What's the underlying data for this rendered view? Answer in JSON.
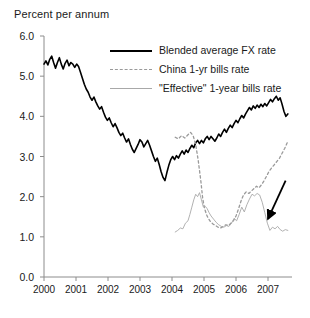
{
  "chart_data": {
    "type": "line",
    "title": "Percent per annum",
    "xlabel": "",
    "ylabel": "Percent per annum",
    "xlim": [
      2000,
      2007.75
    ],
    "ylim": [
      0.0,
      6.0
    ],
    "grid": false,
    "legend_position": "top-right-inside",
    "ytick_labels": [
      "0.0",
      "1.0",
      "2.0",
      "3.0",
      "4.0",
      "5.0",
      "6.0"
    ],
    "ytick_values": [
      0.0,
      1.0,
      2.0,
      3.0,
      4.0,
      5.0,
      6.0
    ],
    "xtick_labels": [
      "2000",
      "2001",
      "2002",
      "2003",
      "2004",
      "2005",
      "2006",
      "2007"
    ],
    "xtick_values": [
      2000,
      2001,
      2002,
      2003,
      2004,
      2005,
      2006,
      2007
    ],
    "annotations": [
      {
        "name": "arrow-annotation",
        "type": "arrow",
        "from_xy": [
          2007.55,
          2.4
        ],
        "to_xy": [
          2007.0,
          1.45
        ],
        "text": ""
      }
    ],
    "series": [
      {
        "name": "Blended average FX rate",
        "style": "solid",
        "color": "#000000",
        "width": 1.6,
        "x": [
          2000.0,
          2000.06,
          2000.12,
          2000.18,
          2000.24,
          2000.3,
          2000.36,
          2000.42,
          2000.48,
          2000.54,
          2000.6,
          2000.66,
          2000.72,
          2000.78,
          2000.84,
          2000.9,
          2000.96,
          2001.02,
          2001.08,
          2001.14,
          2001.2,
          2001.26,
          2001.32,
          2001.38,
          2001.44,
          2001.5,
          2001.56,
          2001.62,
          2001.68,
          2001.74,
          2001.8,
          2001.86,
          2001.92,
          2001.98,
          2002.04,
          2002.1,
          2002.16,
          2002.22,
          2002.28,
          2002.34,
          2002.4,
          2002.46,
          2002.52,
          2002.58,
          2002.64,
          2002.7,
          2002.76,
          2002.82,
          2002.88,
          2002.94,
          2003.0,
          2003.06,
          2003.12,
          2003.18,
          2003.24,
          2003.3,
          2003.36,
          2003.42,
          2003.48,
          2003.54,
          2003.6,
          2003.66,
          2003.72,
          2003.78,
          2003.84,
          2003.9,
          2003.96,
          2004.02,
          2004.08,
          2004.14,
          2004.2,
          2004.26,
          2004.32,
          2004.38,
          2004.44,
          2004.5,
          2004.56,
          2004.62,
          2004.68,
          2004.74,
          2004.8,
          2004.86,
          2004.92,
          2004.98,
          2005.04,
          2005.1,
          2005.16,
          2005.22,
          2005.28,
          2005.34,
          2005.4,
          2005.46,
          2005.52,
          2005.58,
          2005.64,
          2005.7,
          2005.76,
          2005.82,
          2005.88,
          2005.94,
          2006.0,
          2006.06,
          2006.12,
          2006.18,
          2006.24,
          2006.3,
          2006.36,
          2006.42,
          2006.48,
          2006.54,
          2006.6,
          2006.66,
          2006.72,
          2006.78,
          2006.84,
          2006.9,
          2006.96,
          2007.02,
          2007.08,
          2007.14,
          2007.2,
          2007.26,
          2007.32,
          2007.38,
          2007.44,
          2007.5,
          2007.56,
          2007.62
        ],
        "y": [
          5.3,
          5.38,
          5.28,
          5.42,
          5.5,
          5.34,
          5.2,
          5.34,
          5.46,
          5.3,
          5.18,
          5.32,
          5.4,
          5.26,
          5.34,
          5.3,
          5.22,
          5.3,
          5.24,
          5.1,
          4.95,
          4.8,
          4.68,
          4.6,
          4.48,
          4.4,
          4.48,
          4.36,
          4.26,
          4.18,
          4.24,
          4.1,
          3.98,
          3.9,
          3.96,
          3.84,
          3.74,
          3.82,
          3.72,
          3.6,
          3.52,
          3.58,
          3.46,
          3.36,
          3.44,
          3.3,
          3.18,
          3.1,
          3.2,
          3.3,
          3.42,
          3.36,
          3.24,
          3.32,
          3.4,
          3.28,
          3.14,
          3.0,
          2.88,
          2.96,
          2.8,
          2.62,
          2.48,
          2.4,
          2.6,
          2.78,
          2.92,
          3.0,
          2.92,
          3.02,
          2.96,
          3.06,
          3.14,
          3.06,
          3.16,
          3.1,
          3.2,
          3.28,
          3.22,
          3.34,
          3.4,
          3.32,
          3.4,
          3.34,
          3.44,
          3.5,
          3.42,
          3.5,
          3.44,
          3.38,
          3.46,
          3.56,
          3.5,
          3.6,
          3.68,
          3.6,
          3.7,
          3.78,
          3.72,
          3.82,
          3.9,
          3.84,
          3.94,
          4.02,
          3.96,
          4.06,
          4.14,
          4.22,
          4.16,
          4.26,
          4.2,
          4.28,
          4.22,
          4.3,
          4.24,
          4.32,
          4.26,
          4.34,
          4.42,
          4.36,
          4.44,
          4.5,
          4.4,
          4.46,
          4.3,
          4.12,
          4.0,
          4.06
        ]
      },
      {
        "name": "China 1-yr bills rate",
        "style": "dashed",
        "color": "#9a9a9a",
        "width": 1.3,
        "x": [
          2004.1,
          2004.2,
          2004.3,
          2004.4,
          2004.5,
          2004.58,
          2004.66,
          2004.74,
          2004.82,
          2004.9,
          2004.96,
          2005.02,
          2005.08,
          2005.14,
          2005.2,
          2005.28,
          2005.36,
          2005.44,
          2005.52,
          2005.6,
          2005.68,
          2005.76,
          2005.84,
          2005.92,
          2006.0,
          2006.08,
          2006.16,
          2006.24,
          2006.32,
          2006.4,
          2006.48,
          2006.56,
          2006.64,
          2006.72,
          2006.8,
          2006.88,
          2006.96,
          2007.04,
          2007.12,
          2007.2,
          2007.28,
          2007.36,
          2007.44,
          2007.52,
          2007.6
        ],
        "y": [
          3.48,
          3.44,
          3.52,
          3.46,
          3.54,
          3.6,
          3.52,
          3.3,
          2.9,
          2.4,
          1.95,
          1.7,
          1.55,
          1.45,
          1.38,
          1.32,
          1.28,
          1.24,
          1.22,
          1.26,
          1.3,
          1.28,
          1.34,
          1.4,
          1.52,
          1.7,
          1.9,
          2.05,
          2.12,
          2.08,
          2.14,
          2.2,
          2.26,
          2.22,
          2.3,
          2.4,
          2.52,
          2.64,
          2.72,
          2.8,
          2.88,
          2.96,
          3.08,
          3.2,
          3.34
        ]
      },
      {
        "name": "\"Effective\" 1-year bills rate",
        "style": "solid",
        "color": "#a8a8a8",
        "width": 0.9,
        "x": [
          2004.1,
          2004.18,
          2004.26,
          2004.34,
          2004.42,
          2004.5,
          2004.56,
          2004.62,
          2004.68,
          2004.74,
          2004.8,
          2004.86,
          2004.92,
          2004.98,
          2005.04,
          2005.1,
          2005.16,
          2005.22,
          2005.3,
          2005.38,
          2005.46,
          2005.54,
          2005.62,
          2005.7,
          2005.78,
          2005.86,
          2005.94,
          2006.02,
          2006.1,
          2006.18,
          2006.26,
          2006.34,
          2006.42,
          2006.5,
          2006.58,
          2006.66,
          2006.74,
          2006.82,
          2006.9,
          2006.98,
          2007.06,
          2007.14,
          2007.22,
          2007.3,
          2007.38,
          2007.46,
          2007.54,
          2007.62
        ],
        "y": [
          1.12,
          1.16,
          1.22,
          1.2,
          1.34,
          1.4,
          1.56,
          1.74,
          1.92,
          2.06,
          2.0,
          2.1,
          1.92,
          1.74,
          1.76,
          1.7,
          1.6,
          1.52,
          1.44,
          1.36,
          1.3,
          1.26,
          1.24,
          1.28,
          1.26,
          1.34,
          1.46,
          1.4,
          1.56,
          1.74,
          1.62,
          1.8,
          1.94,
          2.06,
          2.02,
          2.08,
          2.04,
          1.86,
          1.6,
          1.34,
          1.16,
          1.24,
          1.2,
          1.26,
          1.18,
          1.14,
          1.18,
          1.16
        ]
      }
    ]
  },
  "legend": {
    "items": [
      {
        "label": "Blended average FX rate",
        "swatch": "solid-thick"
      },
      {
        "label": "China 1-yr bills rate",
        "swatch": "dashed"
      },
      {
        "label": "\"Effective\" 1-year bills rate",
        "swatch": "solid-thin"
      }
    ]
  }
}
